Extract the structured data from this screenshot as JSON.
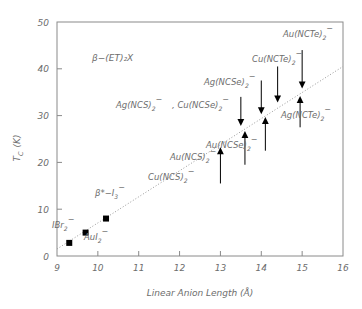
{
  "chart_data": {
    "type": "scatter",
    "title": "",
    "xlabel": "Linear Anion Length (Å)",
    "ylabel": "T_C  (K)",
    "ylabel_main": "T",
    "ylabel_sub": "C",
    "ylabel_unit": "(K)",
    "xlim": [
      9,
      16
    ],
    "ylim": [
      0,
      50
    ],
    "xticks": [
      9,
      10,
      11,
      12,
      13,
      14,
      15,
      16
    ],
    "yticks": [
      0,
      10,
      20,
      30,
      40,
      50
    ],
    "xtick_labels": [
      "9",
      "10",
      "11",
      "12",
      "13",
      "14",
      "15",
      "16"
    ],
    "ytick_labels": [
      "0",
      "10",
      "20",
      "30",
      "40",
      "50"
    ],
    "grid": false,
    "legend": "none",
    "annotation": "β−(ET)₂X",
    "annotation_x": 10.35,
    "annotation_y": 43.5,
    "trendline": {
      "style": "dotted",
      "x0": 9.0,
      "y0": 1.5,
      "x1": 16.0,
      "y1": 40.5,
      "color": "#999999"
    },
    "series": [
      {
        "name": "measured (squares)",
        "marker": "square",
        "color": "#000000",
        "points": [
          {
            "label": "IBr₂⁻",
            "x": 9.3,
            "y": 2.8
          },
          {
            "label": "AuI₂⁻",
            "x": 9.7,
            "y": 5.0
          },
          {
            "label": "β*−I₃⁻",
            "x": 10.2,
            "y": 8.0
          }
        ]
      },
      {
        "name": "predicted (arrow bounds)",
        "marker": "triangle",
        "color": "#000000",
        "points": [
          {
            "label": "Cu(NCS)₂⁻",
            "x": 13.0,
            "y": 23.0,
            "direction": "up",
            "tail_y": 15.5
          },
          {
            "label": "Au(NCS)₂⁻",
            "x": 13.6,
            "y": 26.5,
            "direction": "up",
            "tail_y": 19.5
          },
          {
            "label": "Ag(NCS)₂⁻ , Cu(NCSe)₂⁻",
            "x": 13.5,
            "y": 28.0,
            "direction": "down",
            "tail_y": 34.0
          },
          {
            "label": "Ag(NCSe)₂⁻",
            "x": 14.0,
            "y": 30.5,
            "direction": "down",
            "tail_y": 37.5
          },
          {
            "label": "Au(NCSe)₂⁻",
            "x": 14.1,
            "y": 29.5,
            "direction": "up",
            "tail_y": 22.5
          },
          {
            "label": "Cu(NCTe)₂⁻",
            "x": 14.4,
            "y": 33.0,
            "direction": "down",
            "tail_y": 40.5
          },
          {
            "label": "Au(NCTe)₂⁻",
            "x": 15.0,
            "y": 36.0,
            "direction": "down",
            "tail_y": 44.0
          },
          {
            "label": "Ag(NCTe)₂⁻",
            "x": 14.95,
            "y": 34.0,
            "direction": "up",
            "tail_y": 27.5
          }
        ]
      }
    ],
    "point_labels": [
      {
        "id": "ibr2",
        "text": "IBr",
        "sub": "2",
        "sup": "−",
        "x": 52,
        "y": 228
      },
      {
        "id": "aui2",
        "text": "AuI",
        "sub": "2",
        "sup": "−",
        "x": 84,
        "y": 240
      },
      {
        "id": "beta-i3",
        "text": "β*−I",
        "sub": "3",
        "sup": "−",
        "x": 95,
        "y": 196
      },
      {
        "id": "cuncs2",
        "text": "Cu(NCS)",
        "sub": "2",
        "sup": "−",
        "x": 148,
        "y": 180
      },
      {
        "id": "auncs2",
        "text": "Au(NCS)",
        "sub": "2",
        "sup": "−",
        "x": 170,
        "y": 160
      },
      {
        "id": "agncs2",
        "text": "Ag(NCS)",
        "sub": "2",
        "sup": "−",
        "x": 116,
        "y": 108
      },
      {
        "id": "cuncse2b",
        "text": ", Cu(NCSe)",
        "sub": "2",
        "sup": "−",
        "x": 172,
        "y": 108
      },
      {
        "id": "agncse2",
        "text": "Ag(NCSe)",
        "sub": "2",
        "sup": "−",
        "x": 204,
        "y": 85
      },
      {
        "id": "auncse2",
        "text": "Au(NCSe)",
        "sub": "2",
        "sup": "−",
        "x": 206,
        "y": 148
      },
      {
        "id": "cuncte2",
        "text": "Cu(NCTe)",
        "sub": "2",
        "sup": "−",
        "x": 252,
        "y": 62
      },
      {
        "id": "auncte2",
        "text": "Au(NCTe)",
        "sub": "2",
        "sup": "−",
        "x": 283,
        "y": 37
      },
      {
        "id": "agncte2",
        "text": "Ag(NCTe)",
        "sub": "2",
        "sup": "−",
        "x": 281,
        "y": 118
      }
    ]
  }
}
